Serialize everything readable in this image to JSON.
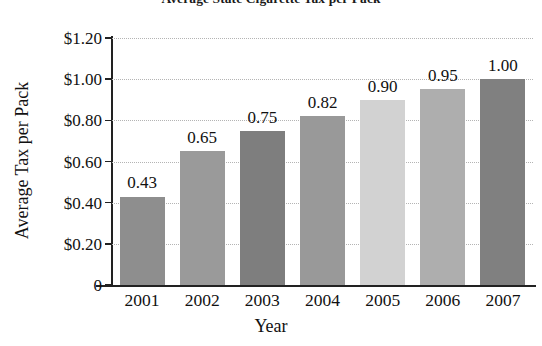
{
  "chart_data": {
    "type": "bar",
    "title": "Average State Cigarette Tax per Pack",
    "xlabel": "Year",
    "ylabel": "Average Tax per Pack",
    "categories": [
      "2001",
      "2002",
      "2003",
      "2004",
      "2005",
      "2006",
      "2007"
    ],
    "values": [
      0.43,
      0.65,
      0.75,
      0.82,
      0.9,
      0.95,
      1.0
    ],
    "value_labels": [
      "0.43",
      "0.65",
      "0.75",
      "0.82",
      "0.90",
      "0.95",
      "1.00"
    ],
    "bar_colors": [
      "#8e8e8e",
      "#9a9a9a",
      "#7e7e7e",
      "#999999",
      "#d2d2d2",
      "#aeaeae",
      "#808080"
    ],
    "ylim": [
      0,
      1.2
    ],
    "ytick_values": [
      1.2,
      1.0,
      0.8,
      0.6,
      0.4,
      0.2,
      0
    ],
    "ytick_labels": [
      "$1.20",
      "$1.00",
      "$0.80",
      "$0.60",
      "$0.40",
      "$0.20",
      "0"
    ],
    "grid": "horizontal-dotted",
    "legend": "none",
    "gridline_color": "#b4b4b4",
    "axis_color": "#222222",
    "text_color": "#111111"
  }
}
